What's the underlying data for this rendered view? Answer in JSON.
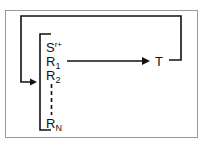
{
  "diagram": {
    "frame_color": "#888888",
    "line_color": "#111111",
    "list_items": {
      "s": {
        "base": "S",
        "sup": "r+"
      },
      "r1": {
        "base": "R",
        "sub": "1"
      },
      "r2": {
        "base": "R",
        "sub": "2"
      },
      "rn": {
        "base": "R",
        "sub": "N"
      }
    },
    "target": {
      "label": "T"
    }
  }
}
